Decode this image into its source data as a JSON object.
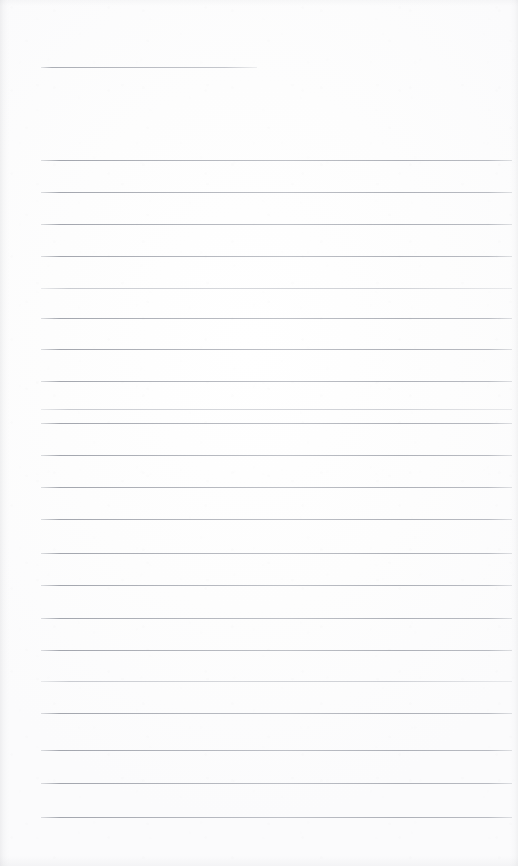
{
  "document": {
    "title": "Blank Lined Notepad Page",
    "kind": "scanned-lined-paper",
    "page_width": 518,
    "page_height": 866,
    "background_color": "#fdfdfd",
    "rule_color": "#8f939c",
    "edge_shadow_color": "#96989e",
    "text_content": "",
    "body_text": ""
  },
  "header_rule": {
    "name": "header-rule",
    "x_start": 41,
    "x_end": 257,
    "y": 67,
    "width": 216,
    "thickness": 1
  },
  "ruled_lines": {
    "count": 21,
    "x_start": 41,
    "x_end": 512,
    "width": 471,
    "thickness": 1,
    "spacing": 32,
    "items": [
      {
        "index": 1,
        "y": 160,
        "weight": "normal"
      },
      {
        "index": 2,
        "y": 192,
        "weight": "normal"
      },
      {
        "index": 3,
        "y": 224,
        "weight": "normal"
      },
      {
        "index": 4,
        "y": 256,
        "weight": "normal"
      },
      {
        "index": 5,
        "y": 288,
        "weight": "light"
      },
      {
        "index": 6,
        "y": 318,
        "weight": "normal"
      },
      {
        "index": 7,
        "y": 349,
        "weight": "normal"
      },
      {
        "index": 8,
        "y": 381,
        "weight": "normal"
      },
      {
        "index": 9,
        "y": 409,
        "weight": "light"
      },
      {
        "index": 10,
        "y": 423,
        "weight": "normal"
      },
      {
        "index": 11,
        "y": 455,
        "weight": "normal"
      },
      {
        "index": 12,
        "y": 487,
        "weight": "normal"
      },
      {
        "index": 13,
        "y": 519,
        "weight": "normal"
      },
      {
        "index": 14,
        "y": 553,
        "weight": "normal"
      },
      {
        "index": 15,
        "y": 585,
        "weight": "normal"
      },
      {
        "index": 16,
        "y": 618,
        "weight": "normal"
      },
      {
        "index": 17,
        "y": 650,
        "weight": "normal"
      },
      {
        "index": 18,
        "y": 681,
        "weight": "light"
      },
      {
        "index": 19,
        "y": 713,
        "weight": "normal"
      },
      {
        "index": 20,
        "y": 750,
        "weight": "normal"
      },
      {
        "index": 21,
        "y": 783,
        "weight": "normal"
      },
      {
        "index": 22,
        "y": 817,
        "weight": "normal"
      }
    ]
  }
}
